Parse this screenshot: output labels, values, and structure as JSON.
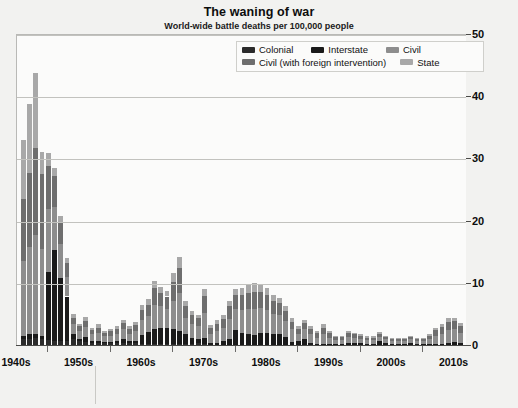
{
  "chart_data": {
    "type": "bar",
    "title": "The waning of war",
    "subtitle": "World-wide battle deaths per 100,000 people",
    "xlabel": "",
    "ylabel": "",
    "stacked": true,
    "grid": true,
    "legend_position": "top-right",
    "ylim": [
      0,
      50
    ],
    "yticks": [
      0,
      10,
      20,
      30,
      40,
      50
    ],
    "ytick_labels": [
      "0",
      "10",
      "20",
      "30",
      "40",
      "50"
    ],
    "y_axis_side": "right",
    "xtick_labels": [
      "1940s",
      "1950s",
      "1960s",
      "1970s",
      "1980s",
      "1990s",
      "2000s",
      "2010s"
    ],
    "xtick_years": [
      1945,
      1955,
      1965,
      1975,
      1985,
      1995,
      2005,
      2015
    ],
    "xlim": [
      1945,
      2017
    ],
    "series": [
      {
        "name": "Colonial",
        "color": "#2b2b2b"
      },
      {
        "name": "Interstate",
        "color": "#1a1a1a"
      },
      {
        "name": "Civil",
        "color": "#8d8d8d"
      },
      {
        "name": "Civil (with foreign intervention)",
        "color": "#6e6e6e"
      },
      {
        "name": "State",
        "color": "#a8a8a8"
      }
    ],
    "x": [
      1946,
      1947,
      1948,
      1949,
      1950,
      1951,
      1952,
      1953,
      1954,
      1955,
      1956,
      1957,
      1958,
      1959,
      1960,
      1961,
      1962,
      1963,
      1964,
      1965,
      1966,
      1967,
      1968,
      1969,
      1970,
      1971,
      1972,
      1973,
      1974,
      1975,
      1976,
      1977,
      1978,
      1979,
      1980,
      1981,
      1982,
      1983,
      1984,
      1985,
      1986,
      1987,
      1988,
      1989,
      1990,
      1991,
      1992,
      1993,
      1994,
      1995,
      1996,
      1997,
      1998,
      1999,
      2000,
      2001,
      2002,
      2003,
      2004,
      2005,
      2006,
      2007,
      2008,
      2009,
      2010,
      2011,
      2012,
      2013,
      2014,
      2015,
      2016
    ],
    "values_by_series": {
      "Colonial": [
        0.9,
        1.0,
        1.1,
        1.0,
        0.8,
        0.7,
        0.7,
        0.6,
        0.9,
        0.6,
        0.5,
        0.4,
        0.3,
        0.3,
        0.3,
        0.3,
        0.4,
        0.3,
        0.3,
        0.2,
        0.2,
        0.2,
        0.2,
        0.2,
        0.2,
        0.2,
        0.2,
        0.2,
        0.3,
        0.2,
        0,
        0,
        0,
        0,
        0,
        0,
        0,
        0,
        0,
        0,
        0,
        0,
        0,
        0,
        0,
        0,
        0,
        0,
        0,
        0,
        0,
        0,
        0,
        0,
        0,
        0,
        0,
        0,
        0,
        0,
        0,
        0,
        0,
        0,
        0,
        0,
        0,
        0,
        0,
        0,
        0
      ],
      "Interstate": [
        0.6,
        0.7,
        0.6,
        0.5,
        11.0,
        14.5,
        10.0,
        7.2,
        0.9,
        0.4,
        0.8,
        0.3,
        0.3,
        0.2,
        0.2,
        0.3,
        0.5,
        0.3,
        0.4,
        1.4,
        1.9,
        2.3,
        2.6,
        2.6,
        2.3,
        2.0,
        1.6,
        1.0,
        0.7,
        1.0,
        0.4,
        0.4,
        0.6,
        1.0,
        2.4,
        2.0,
        1.8,
        1.6,
        2.0,
        2.0,
        1.8,
        1.8,
        1.3,
        0.5,
        0.6,
        0.9,
        0.3,
        0.2,
        0.2,
        0.2,
        0.1,
        0.1,
        0.4,
        0.4,
        0.3,
        0.2,
        0.2,
        0.6,
        0.3,
        0.2,
        0.2,
        0.2,
        0.3,
        0.2,
        0.2,
        0.2,
        0.2,
        0.2,
        0.4,
        0.5,
        0.4
      ],
      "Civil": [
        12.0,
        14.0,
        16.0,
        14.0,
        10.0,
        7.0,
        5.5,
        3.2,
        1.6,
        1.2,
        1.6,
        1.0,
        1.3,
        0.9,
        1.0,
        1.2,
        1.6,
        1.2,
        1.5,
        2.4,
        2.6,
        4.0,
        3.4,
        3.0,
        4.6,
        6.2,
        2.6,
        2.2,
        2.0,
        4.0,
        1.4,
        1.8,
        2.2,
        3.2,
        3.4,
        3.6,
        4.0,
        4.2,
        4.0,
        3.6,
        3.2,
        3.0,
        2.6,
        2.0,
        1.2,
        1.6,
        1.4,
        1.0,
        1.6,
        1.0,
        0.7,
        0.7,
        0.9,
        0.8,
        0.7,
        0.6,
        0.6,
        0.7,
        0.6,
        0.5,
        0.5,
        0.5,
        0.6,
        0.5,
        0.5,
        0.8,
        1.3,
        1.6,
        2.0,
        2.0,
        1.6
      ],
      "Civil (with foreign intervention)": [
        10.0,
        12.0,
        14.0,
        12.0,
        7.0,
        5.0,
        3.5,
        2.2,
        1.0,
        0.8,
        1.0,
        0.7,
        0.9,
        0.6,
        0.7,
        0.8,
        1.0,
        0.8,
        1.0,
        1.6,
        1.8,
        2.6,
        2.2,
        2.0,
        3.0,
        4.0,
        1.8,
        1.4,
        1.3,
        2.6,
        0.9,
        1.2,
        1.4,
        2.0,
        2.2,
        2.4,
        2.6,
        2.8,
        2.6,
        2.4,
        2.0,
        1.9,
        1.6,
        1.2,
        0.8,
        1.0,
        0.9,
        0.7,
        1.0,
        0.7,
        0.5,
        0.5,
        0.6,
        0.5,
        0.5,
        0.4,
        0.4,
        0.5,
        0.4,
        0.3,
        0.3,
        0.3,
        0.4,
        0.3,
        0.3,
        0.5,
        0.9,
        1.1,
        1.3,
        1.3,
        1.1
      ],
      "State": [
        9.5,
        11.0,
        12.0,
        3.5,
        2.0,
        1.2,
        1.0,
        0.8,
        0.6,
        0.4,
        0.6,
        0.4,
        0.5,
        0.3,
        0.4,
        0.4,
        0.6,
        0.4,
        0.5,
        0.8,
        0.9,
        1.2,
        1.0,
        0.9,
        1.4,
        1.8,
        0.8,
        0.6,
        0.6,
        1.2,
        0.5,
        0.6,
        0.7,
        0.9,
        1.0,
        1.1,
        1.2,
        1.3,
        1.2,
        1.1,
        1.0,
        0.9,
        0.8,
        0.6,
        0.4,
        0.5,
        0.4,
        0.3,
        0.5,
        0.3,
        0.2,
        0.2,
        0.3,
        0.3,
        0.2,
        0.2,
        0.2,
        0.3,
        0.2,
        0.2,
        0.2,
        0.2,
        0.2,
        0.2,
        0.2,
        0.3,
        0.4,
        0.5,
        0.6,
        0.6,
        0.5
      ]
    },
    "totals": [
      33.0,
      38.7,
      43.7,
      31.0,
      30.8,
      28.4,
      20.7,
      14.0,
      5.0,
      3.4,
      4.5,
      2.8,
      3.3,
      2.3,
      2.6,
      3.0,
      4.1,
      3.0,
      3.7,
      6.4,
      7.4,
      10.3,
      9.4,
      8.7,
      11.5,
      14.2,
      7.0,
      5.4,
      4.9,
      9.0,
      3.2,
      4.0,
      4.9,
      7.1,
      9.0,
      9.1,
      9.6,
      9.9,
      9.8,
      9.1,
      8.0,
      7.6,
      6.3,
      4.3,
      3.0,
      4.0,
      3.0,
      2.2,
      3.3,
      2.2,
      1.5,
      1.5,
      2.2,
      2.0,
      1.7,
      1.4,
      1.4,
      2.1,
      1.5,
      1.2,
      1.2,
      1.2,
      1.5,
      1.2,
      1.2,
      1.8,
      2.8,
      3.4,
      4.3,
      4.4,
      3.6
    ]
  }
}
